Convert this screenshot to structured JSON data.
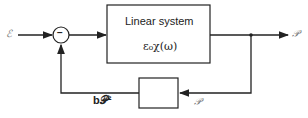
{
  "diagram": {
    "input_label": "𝒫",
    "input_symbol": "ℰ",
    "summing_junction_sign": "−",
    "main_block": {
      "title": "Linear system",
      "transfer": "ε₀χ(ω)"
    },
    "output_label": "𝒫",
    "feedback_input_label": "𝒫",
    "feedback_output_label": "b𝒫²",
    "feedback_block_label": ""
  }
}
